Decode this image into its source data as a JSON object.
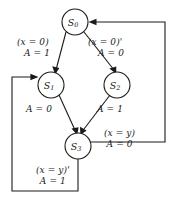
{
  "diagram": {
    "type": "finite-state-machine",
    "line_color": "#1a1a1a",
    "background_color": "#ffffff",
    "nodes": [
      {
        "id": "S0",
        "label": "S",
        "sub": "0",
        "cx": 75,
        "cy": 22,
        "r": 13
      },
      {
        "id": "S1",
        "label": "S",
        "sub": "1",
        "cx": 51,
        "cy": 85,
        "r": 13
      },
      {
        "id": "S2",
        "label": "S",
        "sub": "2",
        "cx": 117,
        "cy": 85,
        "r": 13
      },
      {
        "id": "S3",
        "label": "S",
        "sub": "3",
        "cx": 78,
        "cy": 146,
        "r": 13
      }
    ],
    "edges": [
      {
        "id": "e-s0-s1",
        "from": "S0",
        "to": "S1",
        "condition": "(x = 0)",
        "output": "A = 1"
      },
      {
        "id": "e-s0-s2",
        "from": "S0",
        "to": "S2",
        "condition": "(x = 0)'",
        "output": "A = 0"
      },
      {
        "id": "e-s1-s3",
        "from": "S1",
        "to": "S3",
        "condition": "",
        "output": "A = 0"
      },
      {
        "id": "e-s2-s3",
        "from": "S2",
        "to": "S3",
        "condition": "",
        "output": "A = 1"
      },
      {
        "id": "e-s3-s0",
        "from": "S3",
        "to": "S0",
        "condition": "(x = y)",
        "output": "A = 0"
      },
      {
        "id": "e-s3-s1",
        "from": "S3",
        "to": "S1",
        "condition": "(x = y)'",
        "output": "A = 1"
      }
    ]
  }
}
